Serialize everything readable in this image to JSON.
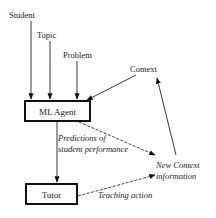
{
  "diagram": {
    "inputs": {
      "student": "Student",
      "topic": "Topic",
      "problem": "Problem",
      "context": "Context"
    },
    "nodes": {
      "ml_agent": "ML Agent",
      "tutor": "Tutor"
    },
    "edge_labels": {
      "predictions_line1": "Predictions of",
      "predictions_line2": "student performance",
      "teaching_action": "Teaching action"
    },
    "outputs": {
      "new_context_line1": "New Context",
      "new_context_line2": "information"
    }
  }
}
